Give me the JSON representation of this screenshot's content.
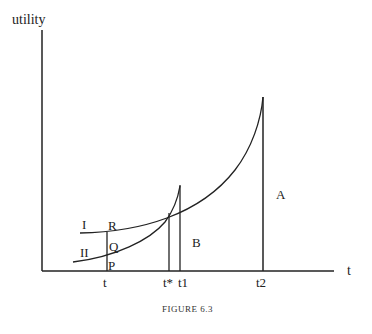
{
  "figure": {
    "caption": "FIGURE 6.3",
    "y_axis_label": "utility",
    "x_axis_label": "t"
  },
  "curves": [
    {
      "name": "I",
      "label": "I"
    },
    {
      "name": "II",
      "label": "II"
    }
  ],
  "points": {
    "R": "R",
    "Q": "Q",
    "P": "P"
  },
  "x_ticks": {
    "t": "t",
    "t_star": "t*",
    "t1": "t1",
    "t2": "t2"
  },
  "regions": {
    "A": "A",
    "B": "B"
  },
  "colors": {
    "line": "#222222",
    "background": "#ffffff"
  }
}
